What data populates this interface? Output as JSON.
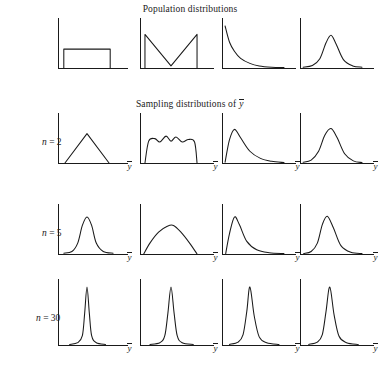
{
  "figure": {
    "titles": {
      "population": "Population distributions",
      "sampling_prefix": "Sampling distributions of ",
      "sampling_symbol": "y"
    },
    "axis_label": "y",
    "row_labels": [
      {
        "var": "n",
        "text": " = 2"
      },
      {
        "var": "n",
        "text": " = 5"
      },
      {
        "var": "n",
        "text": " = 30"
      }
    ],
    "stroke_color": "#1a1a1a"
  },
  "chart_data": {
    "type": "line",
    "subtitle": "Sampling distributions of y",
    "xlabel": "y",
    "ylabel": "",
    "grid": false,
    "legend": "none",
    "columns": [
      {
        "name": "Uniform population"
      },
      {
        "name": "U-shaped (bimodal) population"
      },
      {
        "name": "Exponential (right-skewed) population"
      },
      {
        "name": "Normal (bell-shaped) population"
      }
    ],
    "rows": [
      {
        "name": "Population",
        "n": null
      },
      {
        "name": "Sampling distribution",
        "n": 2
      },
      {
        "name": "Sampling distribution",
        "n": 5
      },
      {
        "name": "Sampling distribution",
        "n": 30
      }
    ],
    "panels": [
      {
        "row": "Population",
        "n": null,
        "column": "Uniform population",
        "shape": "uniform",
        "x": [
          0.1,
          0.1,
          0.9,
          0.9
        ],
        "y": [
          0.0,
          0.45,
          0.45,
          0.0
        ]
      },
      {
        "row": "Population",
        "n": null,
        "column": "U-shaped (bimodal) population",
        "shape": "u-shaped-v",
        "x": [
          0.08,
          0.08,
          0.5,
          0.92,
          0.92
        ],
        "y": [
          0.0,
          0.8,
          0.05,
          0.8,
          0.0
        ]
      },
      {
        "row": "Population",
        "n": null,
        "column": "Exponential (right-skewed) population",
        "shape": "exponential",
        "x": [
          0.05,
          0.12,
          0.2,
          0.3,
          0.45,
          0.6,
          0.8,
          1.0
        ],
        "y": [
          1.0,
          0.62,
          0.4,
          0.23,
          0.11,
          0.05,
          0.02,
          0.01
        ]
      },
      {
        "row": "Population",
        "n": null,
        "column": "Normal (bell-shaped) population",
        "shape": "normal",
        "x": [
          0.05,
          0.2,
          0.32,
          0.42,
          0.5,
          0.58,
          0.7,
          0.85,
          1.0
        ],
        "y": [
          0.02,
          0.06,
          0.22,
          0.6,
          0.78,
          0.58,
          0.2,
          0.05,
          0.02
        ]
      },
      {
        "row": "Sampling distribution",
        "n": 2,
        "column": "Uniform population",
        "shape": "triangular",
        "x": [
          0.12,
          0.5,
          0.88
        ],
        "y": [
          0.0,
          0.7,
          0.0
        ]
      },
      {
        "row": "Sampling distribution",
        "n": 2,
        "column": "U-shaped (bimodal) population",
        "shape": "flat-top-bumpy",
        "x": [
          0.08,
          0.14,
          0.24,
          0.32,
          0.42,
          0.5,
          0.58,
          0.68,
          0.78,
          0.88,
          0.92
        ],
        "y": [
          0.0,
          0.52,
          0.58,
          0.5,
          0.64,
          0.52,
          0.62,
          0.5,
          0.56,
          0.5,
          0.0
        ]
      },
      {
        "row": "Sampling distribution",
        "n": 2,
        "column": "Exponential (right-skewed) population",
        "shape": "right-skewed",
        "x": [
          0.05,
          0.12,
          0.2,
          0.3,
          0.45,
          0.62,
          0.8,
          1.0
        ],
        "y": [
          0.02,
          0.55,
          0.8,
          0.6,
          0.28,
          0.11,
          0.04,
          0.01
        ]
      },
      {
        "row": "Sampling distribution",
        "n": 2,
        "column": "Normal (bell-shaped) population",
        "shape": "normal",
        "x": [
          0.05,
          0.18,
          0.3,
          0.4,
          0.5,
          0.6,
          0.72,
          0.86,
          1.0
        ],
        "y": [
          0.02,
          0.07,
          0.28,
          0.66,
          0.82,
          0.6,
          0.22,
          0.05,
          0.01
        ]
      },
      {
        "row": "Sampling distribution",
        "n": 5,
        "column": "Uniform population",
        "shape": "normal-narrow",
        "x": [
          0.1,
          0.24,
          0.34,
          0.42,
          0.5,
          0.58,
          0.66,
          0.78,
          0.95
        ],
        "y": [
          0.02,
          0.06,
          0.26,
          0.68,
          0.88,
          0.68,
          0.26,
          0.06,
          0.02
        ]
      },
      {
        "row": "Sampling distribution",
        "n": 5,
        "column": "U-shaped (bimodal) population",
        "shape": "broad-mound",
        "x": [
          0.06,
          0.16,
          0.3,
          0.44,
          0.54,
          0.66,
          0.8,
          0.92
        ],
        "y": [
          0.0,
          0.26,
          0.52,
          0.66,
          0.68,
          0.52,
          0.26,
          0.0
        ]
      },
      {
        "row": "Sampling distribution",
        "n": 5,
        "column": "Exponential (right-skewed) population",
        "shape": "right-skewed-narrow",
        "x": [
          0.06,
          0.12,
          0.2,
          0.28,
          0.4,
          0.56,
          0.76,
          1.0
        ],
        "y": [
          0.01,
          0.48,
          0.88,
          0.7,
          0.3,
          0.1,
          0.03,
          0.01
        ]
      },
      {
        "row": "Sampling distribution",
        "n": 5,
        "column": "Normal (bell-shaped) population",
        "shape": "normal-narrow",
        "x": [
          0.06,
          0.18,
          0.28,
          0.36,
          0.44,
          0.54,
          0.66,
          0.82,
          1.0
        ],
        "y": [
          0.01,
          0.06,
          0.26,
          0.7,
          0.9,
          0.62,
          0.2,
          0.04,
          0.01
        ]
      },
      {
        "row": "Sampling distribution",
        "n": 30,
        "column": "Uniform population",
        "shape": "spike",
        "x": [
          0.2,
          0.34,
          0.42,
          0.46,
          0.5,
          0.54,
          0.58,
          0.66,
          0.82
        ],
        "y": [
          0.01,
          0.04,
          0.16,
          0.55,
          1.0,
          0.55,
          0.16,
          0.04,
          0.01
        ]
      },
      {
        "row": "Sampling distribution",
        "n": 30,
        "column": "U-shaped (bimodal) population",
        "shape": "spike",
        "x": [
          0.16,
          0.32,
          0.4,
          0.45,
          0.5,
          0.55,
          0.6,
          0.68,
          0.86
        ],
        "y": [
          0.01,
          0.04,
          0.16,
          0.55,
          1.0,
          0.55,
          0.16,
          0.04,
          0.01
        ]
      },
      {
        "row": "Sampling distribution",
        "n": 30,
        "column": "Exponential (right-skewed) population",
        "shape": "spike",
        "x": [
          0.12,
          0.26,
          0.34,
          0.4,
          0.45,
          0.52,
          0.6,
          0.72,
          0.92
        ],
        "y": [
          0.01,
          0.05,
          0.18,
          0.58,
          1.0,
          0.5,
          0.14,
          0.04,
          0.01
        ]
      },
      {
        "row": "Sampling distribution",
        "n": 30,
        "column": "Normal (bell-shaped) population",
        "shape": "spike",
        "x": [
          0.14,
          0.28,
          0.36,
          0.42,
          0.48,
          0.55,
          0.63,
          0.75,
          0.94
        ],
        "y": [
          0.01,
          0.05,
          0.18,
          0.58,
          1.0,
          0.52,
          0.15,
          0.04,
          0.01
        ]
      }
    ]
  }
}
